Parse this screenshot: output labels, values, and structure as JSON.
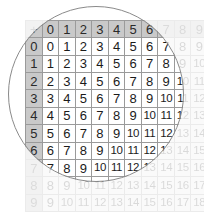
{
  "figure": {
    "kind": "addition-table-with-magnifier",
    "operator_symbol": "+",
    "magnifier": {
      "shape": "circle",
      "center_x": 96,
      "center_y": 94,
      "radius": 88,
      "stroke_color": "#8a8a8a"
    },
    "colors": {
      "header_fill": "#c9c9c9",
      "cell_fill": "#ffffff",
      "grid_line": "#9a9a9a",
      "text": "#1b1b1b",
      "page_background": "#ffffff"
    }
  },
  "chart_data": {
    "type": "table",
    "title": "",
    "xlabel": "",
    "ylabel": "",
    "corner_label": "+",
    "columns": [
      "0",
      "1",
      "2",
      "3",
      "4",
      "5",
      "6",
      "7",
      "8",
      "9"
    ],
    "rows": [
      "0",
      "1",
      "2",
      "3",
      "4",
      "5",
      "6",
      "7",
      "8",
      "9"
    ],
    "values": [
      [
        "0",
        "1",
        "2",
        "3",
        "4",
        "5",
        "6",
        "7",
        "8",
        "9"
      ],
      [
        "1",
        "2",
        "3",
        "4",
        "5",
        "6",
        "7",
        "8",
        "9",
        "10"
      ],
      [
        "2",
        "3",
        "4",
        "5",
        "6",
        "7",
        "8",
        "9",
        "10",
        "11"
      ],
      [
        "3",
        "4",
        "5",
        "6",
        "7",
        "8",
        "9",
        "10",
        "11",
        "12"
      ],
      [
        "4",
        "5",
        "6",
        "7",
        "8",
        "9",
        "10",
        "11",
        "12",
        "13"
      ],
      [
        "5",
        "6",
        "7",
        "8",
        "9",
        "10",
        "11",
        "12",
        "13",
        "14"
      ],
      [
        "6",
        "7",
        "8",
        "9",
        "10",
        "11",
        "12",
        "13",
        "14",
        "15"
      ],
      [
        "7",
        "8",
        "9",
        "10",
        "11",
        "12",
        "13",
        "14",
        "15",
        "16"
      ],
      [
        "8",
        "9",
        "10",
        "11",
        "12",
        "13",
        "14",
        "15",
        "16",
        "17"
      ],
      [
        "9",
        "10",
        "11",
        "12",
        "13",
        "14",
        "15",
        "16",
        "17",
        "18"
      ]
    ]
  }
}
